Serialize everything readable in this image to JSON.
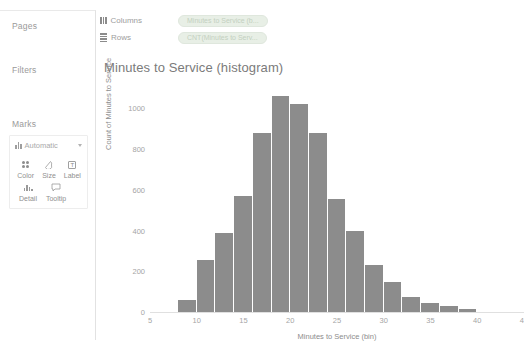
{
  "app": {
    "bar_color": "#8c8c8c",
    "pill_color": "#e8efe6",
    "text_color": "#8d8d8d"
  },
  "sidebar": {
    "pages_label": "Pages",
    "filters_label": "Filters",
    "marks_label": "Marks",
    "marks": {
      "type_label": "Automatic",
      "buttons": [
        {
          "label": "Color",
          "icon": "color-icon"
        },
        {
          "label": "Size",
          "icon": "size-icon"
        },
        {
          "label": "Label",
          "icon": "label-icon"
        },
        {
          "label": "Detail",
          "icon": "detail-icon"
        },
        {
          "label": "Tooltip",
          "icon": "tooltip-icon"
        }
      ]
    }
  },
  "shelves": [
    {
      "name": "Columns",
      "icon": "columns-icon",
      "pill": "Minutes to Service (b..."
    },
    {
      "name": "Rows",
      "icon": "rows-icon",
      "pill": "CNT(Minutes to Serv..."
    }
  ],
  "chart_data": {
    "type": "bar",
    "title": "Minutes to Service (histogram)",
    "xlabel": "Minutes to Service (bin)",
    "ylabel": "Count of Minutes to Service",
    "xlim": [
      5,
      45
    ],
    "ylim": [
      0,
      1100
    ],
    "grid": false,
    "legend": "none",
    "xticks": [
      5,
      10,
      15,
      20,
      25,
      30,
      35,
      40,
      45
    ],
    "yticks": [
      0,
      200,
      400,
      600,
      800,
      1000
    ],
    "bin_width": 2,
    "bins": [
      9,
      11,
      13,
      15,
      17,
      19,
      21,
      23,
      25,
      27,
      29,
      31,
      33,
      35,
      37,
      39
    ],
    "categories": [
      "9",
      "11",
      "13",
      "15",
      "17",
      "19",
      "21",
      "23",
      "25",
      "27",
      "29",
      "31",
      "33",
      "35",
      "37",
      "39"
    ],
    "values": [
      60,
      255,
      390,
      570,
      880,
      1060,
      1020,
      880,
      555,
      400,
      230,
      145,
      75,
      45,
      30,
      15
    ]
  }
}
